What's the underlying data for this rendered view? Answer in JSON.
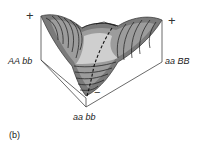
{
  "figure": {
    "panel_label": "(b)",
    "genotype_labels": {
      "left": "AA bb",
      "right": "aa BB",
      "bottom": "aa bb"
    },
    "signs": {
      "left_peak": "+",
      "right_peak": "+",
      "valley": "−"
    },
    "colors": {
      "surface_dark": "#6e6e6e",
      "surface_mid": "#9a9a9a",
      "surface_light": "#c9c9c9",
      "contour": "#1a1a1a",
      "box_edge": "#444444"
    }
  }
}
